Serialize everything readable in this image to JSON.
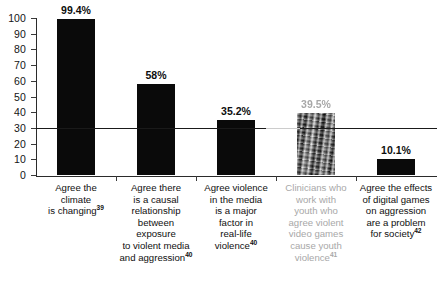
{
  "chart_data": {
    "type": "bar",
    "title": "",
    "subtitle": "",
    "xlabel": "",
    "ylabel": "",
    "ylim": [
      0,
      100
    ],
    "ytick_step": 10,
    "ytick_labels": [
      "0",
      "10",
      "20",
      "30",
      "40",
      "50",
      "60",
      "70",
      "80",
      "90",
      "100"
    ],
    "grid": false,
    "legend": "none",
    "bar_color": "#0a0a0a",
    "categories": [
      "Agree the climate is changing",
      "Agree there is a causal relationship between exposure to violent media and aggression",
      "Agree violence in the media is a major factor in real-life violence",
      "Clinicians who work with youth who agree violent video games cause youth violence",
      "Agree the effects of digital games on aggression are a problem for society"
    ],
    "values": [
      99.4,
      58,
      35.2,
      39.5,
      10.1
    ],
    "value_labels": [
      "99.4%",
      "58%",
      "35.2%",
      "39.5%",
      "10.1%"
    ],
    "footnote_markers": [
      "39",
      "40",
      "40",
      "41",
      "42"
    ],
    "annotations": [
      {
        "name": "reference-line",
        "type": "horizontal-line",
        "value": 30,
        "label": ""
      }
    ]
  },
  "axis": {
    "y_ticks": [
      {
        "label": "100",
        "value": 100
      },
      {
        "label": "90",
        "value": 90
      },
      {
        "label": "80",
        "value": 80
      },
      {
        "label": "70",
        "value": 70
      },
      {
        "label": "60",
        "value": 60
      },
      {
        "label": "50",
        "value": 50
      },
      {
        "label": "40",
        "value": 40
      },
      {
        "label": "30",
        "value": 30
      },
      {
        "label": "20",
        "value": 20
      },
      {
        "label": "10",
        "value": 10
      },
      {
        "label": "0",
        "value": 0
      }
    ]
  },
  "categories_lines": [
    {
      "lines": [
        "Agree the",
        "climate",
        "is changing"
      ],
      "sup": "39",
      "faded": false
    },
    {
      "lines": [
        "Agree there",
        "is a causal",
        "relationship",
        "between exposure",
        "to violent media",
        "and aggression"
      ],
      "sup": "40",
      "faded": false
    },
    {
      "lines": [
        "Agree violence",
        "in the media",
        "is a major",
        "factor in",
        "real-life",
        "violence"
      ],
      "sup": "40",
      "faded": false
    },
    {
      "lines": [
        "Clinicians who",
        "work with",
        "youth who",
        "agree violent",
        "video games",
        "cause youth",
        "violence"
      ],
      "sup": "41",
      "faded": true
    },
    {
      "lines": [
        "Agree the effects",
        "of digital games",
        "on aggression",
        "are a problem",
        "for society"
      ],
      "sup": "42",
      "faded": false
    }
  ],
  "bars": [
    {
      "label": "99.4%",
      "value": 99.4,
      "faded": false
    },
    {
      "label": "58%",
      "value": 58,
      "faded": false
    },
    {
      "label": "35.2%",
      "value": 35.2,
      "faded": false
    },
    {
      "label": "39.5%",
      "value": 39.5,
      "faded": true
    },
    {
      "label": "10.1%",
      "value": 10.1,
      "faded": false
    }
  ]
}
